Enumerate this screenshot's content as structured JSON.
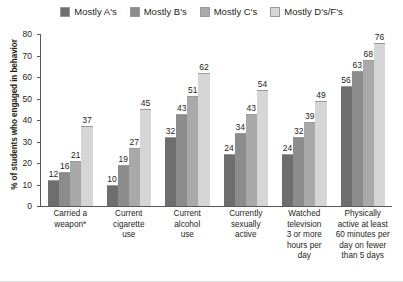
{
  "chart_data": {
    "type": "bar",
    "title": "",
    "xlabel": "",
    "ylabel": "% of students who engaged in behavior",
    "ylim": [
      0,
      80
    ],
    "ytick_step": 10,
    "yticks": [
      80,
      70,
      60,
      50,
      40,
      30,
      20,
      10,
      0
    ],
    "grid": false,
    "legend_position": "top-center",
    "categories": [
      "Carried a weapon*",
      "Current cigarette use",
      "Current alcohol use",
      "Currently sexually active",
      "Watched television 3 or more hours per day",
      "Physically active at least 60 minutes per day on fewer than 5 days"
    ],
    "category_lines": [
      [
        "Carried a",
        "weapon*"
      ],
      [
        "Current",
        "cigarette",
        "use"
      ],
      [
        "Current",
        "alcohol",
        "use"
      ],
      [
        "Currently",
        "sexually",
        "active"
      ],
      [
        "Watched",
        "television",
        "3 or more",
        "hours per",
        "day"
      ],
      [
        "Physically",
        "active at least",
        "60 minutes per",
        "day on fewer",
        "than 5 days"
      ]
    ],
    "series": [
      {
        "name": "Mostly A's",
        "color": "#6e6e6e",
        "values": [
          12,
          10,
          32,
          24,
          24,
          56
        ]
      },
      {
        "name": "Mostly B's",
        "color": "#8c8c8c",
        "values": [
          16,
          19,
          43,
          34,
          32,
          63
        ]
      },
      {
        "name": "Mostly C's",
        "color": "#a9a9a9",
        "values": [
          21,
          27,
          51,
          43,
          39,
          68
        ]
      },
      {
        "name": "Mostly D's/F's",
        "color": "#d6d6d6",
        "values": [
          37,
          45,
          62,
          54,
          49,
          76
        ]
      }
    ]
  },
  "legend": {
    "items": [
      {
        "label": "Mostly A's",
        "color": "#6e6e6e"
      },
      {
        "label": "Mostly B's",
        "color": "#8c8c8c"
      },
      {
        "label": "Mostly C's",
        "color": "#a9a9a9"
      },
      {
        "label": "Mostly D's/F's",
        "color": "#d6d6d6"
      }
    ]
  },
  "colors": {
    "axis": "#58595b",
    "text": "#231f20",
    "background": "#ffffff",
    "bar_border": "#9a9a9a"
  }
}
